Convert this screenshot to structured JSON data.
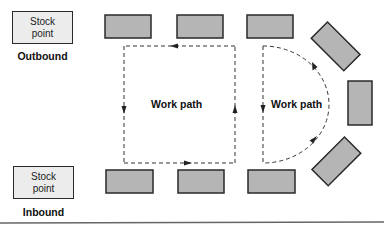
{
  "diagram": {
    "stock_points": [
      {
        "id": "outbound",
        "text": "Stock\npoint",
        "line1": "Stock",
        "line2": "point",
        "label": "Outbound"
      },
      {
        "id": "inbound",
        "text": "Stock\npoint",
        "line1": "Stock",
        "line2": "point",
        "label": "Inbound"
      }
    ],
    "work_paths": [
      {
        "id": "rectangular",
        "label": "Work path",
        "shape": "rectangle",
        "direction": "counter-clockwise"
      },
      {
        "id": "semicircular",
        "label": "Work path",
        "shape": "semicircle",
        "direction": "counter-clockwise"
      }
    ],
    "workstations": {
      "top_row": 3,
      "bottom_row": 3,
      "arc": 3,
      "fill_color": "#b5b5b5",
      "border_color": "#2a2a2a"
    },
    "stock_fill_color": "#ececec"
  }
}
